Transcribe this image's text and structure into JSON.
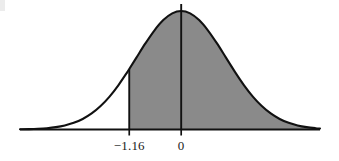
{
  "figure": {
    "kind": "normal-distribution-shaded-area",
    "background_color": "#ffffff",
    "curve_color": "#111111",
    "shade_color": "#8a8a8a",
    "axis_color": "#111111",
    "label_color": "#1a1a1a"
  },
  "axis": {
    "ticks": [
      {
        "label": "−1.16",
        "value": -1.16
      },
      {
        "label": "0",
        "value": 0
      }
    ]
  },
  "chart_data": {
    "type": "area",
    "title": "",
    "subtitle": "",
    "xlabel": "",
    "ylabel": "",
    "grid": false,
    "legend": null,
    "distribution": "standard normal (mean 0, sd 1)",
    "xlim": [
      -3.6,
      3.1
    ],
    "ylim": [
      0,
      0.42
    ],
    "tick_labels": [
      "−1.16",
      "0"
    ],
    "tick_values": [
      -1.16,
      0
    ],
    "shaded_region": {
      "from": -1.16,
      "to": 3.1,
      "direction": "right-tail-from-minus-1.16",
      "fill": "#8a8a8a",
      "approx_area": 0.877
    },
    "vertical_lines": [
      {
        "at": -1.16,
        "from_y": 0,
        "to_y": 0.2036,
        "extends_above_curve": false
      },
      {
        "at": 0,
        "from_y": 0,
        "to_y": 0.42,
        "extends_above_curve": true
      }
    ],
    "x": [
      -3.6,
      -3.4,
      -3.2,
      -3.0,
      -2.8,
      -2.6,
      -2.4,
      -2.2,
      -2.0,
      -1.8,
      -1.6,
      -1.4,
      -1.2,
      -1.16,
      -1.0,
      -0.8,
      -0.6,
      -0.4,
      -0.2,
      0.0,
      0.2,
      0.4,
      0.6,
      0.8,
      1.0,
      1.2,
      1.4,
      1.6,
      1.8,
      2.0,
      2.2,
      2.4,
      2.6,
      2.8,
      3.0,
      3.1
    ],
    "y": [
      0.0006,
      0.0012,
      0.0024,
      0.0044,
      0.0079,
      0.0136,
      0.0224,
      0.0355,
      0.054,
      0.079,
      0.1109,
      0.1497,
      0.1942,
      0.2036,
      0.242,
      0.2897,
      0.3332,
      0.3683,
      0.391,
      0.3989,
      0.391,
      0.3683,
      0.3332,
      0.2897,
      0.242,
      0.1942,
      0.1497,
      0.1109,
      0.079,
      0.054,
      0.0355,
      0.0224,
      0.0136,
      0.0079,
      0.0044,
      0.0033
    ]
  }
}
